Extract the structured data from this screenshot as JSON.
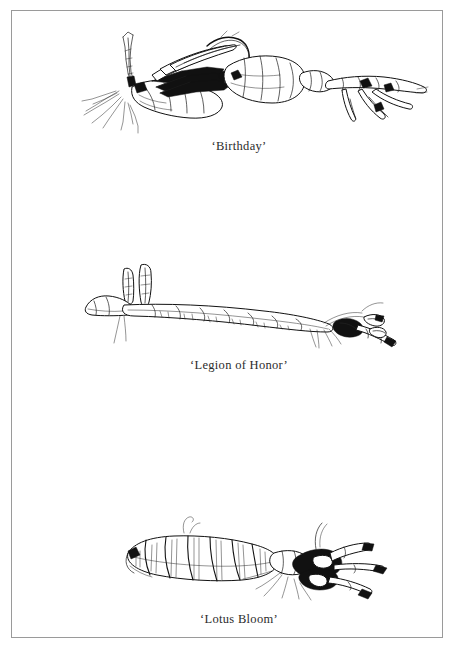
{
  "page": {
    "kind": "illustration-plate",
    "background_color": "#ffffff",
    "border_color": "#9a9a9a",
    "ink_color": "#111111"
  },
  "figures": [
    {
      "id": "figure-1",
      "caption": "‘Birthday’",
      "subject": "iris-rhizome-drawing",
      "position": "top"
    },
    {
      "id": "figure-2",
      "caption": "‘Legion of Honor’",
      "subject": "iris-rhizome-drawing",
      "position": "middle"
    },
    {
      "id": "figure-3",
      "caption": "‘Lotus Bloom’",
      "subject": "iris-rhizome-drawing",
      "position": "bottom"
    }
  ]
}
